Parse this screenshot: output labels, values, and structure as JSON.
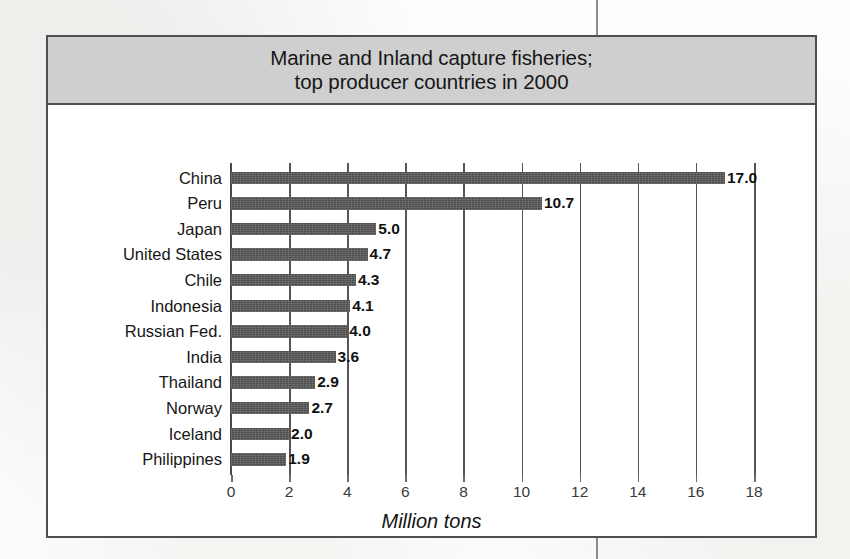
{
  "figure": {
    "title": "Marine and Inland capture fisheries;\ntop producer countries in 2000",
    "axis_title": "Million tons",
    "frame_color": "#4f4f4f",
    "title_band_color": "#cfcfcf",
    "bar_color": "#4d4d4d"
  },
  "chart_data": {
    "type": "bar",
    "orientation": "horizontal",
    "title": "Marine and Inland capture fisheries; top producer countries in 2000",
    "xlabel": "Million tons",
    "ylabel": "",
    "xlim": [
      0,
      18
    ],
    "xticks": [
      0,
      2,
      4,
      6,
      8,
      10,
      12,
      14,
      16,
      18
    ],
    "xtick_labels": [
      "0",
      "2",
      "4",
      "6",
      "8",
      "10",
      "12",
      "14",
      "16",
      "18"
    ],
    "grid": "vertical",
    "legend": "none",
    "categories": [
      "China",
      "Peru",
      "Japan",
      "United States",
      "Chile",
      "Indonesia",
      "Russian Fed.",
      "India",
      "Thailand",
      "Norway",
      "Iceland",
      "Philippines"
    ],
    "values": [
      17.0,
      10.7,
      5.0,
      4.7,
      4.3,
      4.1,
      4.0,
      3.6,
      2.9,
      2.7,
      2.0,
      1.9
    ],
    "value_labels": [
      "17.0",
      "10.7",
      "5.0",
      "4.7",
      "4.3",
      "4.1",
      "4.0",
      "3.6",
      "2.9",
      "2.7",
      "2.0",
      "1.9"
    ]
  }
}
